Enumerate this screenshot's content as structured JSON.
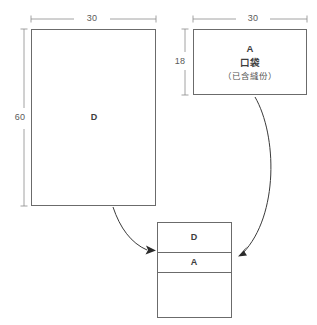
{
  "diagram": {
    "title": "",
    "pieces": [
      {
        "id": "piece-d",
        "label": "D",
        "width_label": "30",
        "height_label": "60"
      },
      {
        "id": "piece-a",
        "label": "A",
        "name_cn": "口袋",
        "note_cn": "（已含縫份）",
        "width_label": "30",
        "height_label": "18"
      }
    ],
    "assembly": {
      "bands": [
        {
          "label": "D"
        },
        {
          "label": "A"
        },
        {
          "label": ""
        }
      ]
    },
    "colors": {
      "outline": "#6b6b6b",
      "dimension": "#8a8a8a",
      "arrow": "#2b2b2b",
      "text": "#3d3d3d",
      "background": "#ffffff"
    }
  }
}
